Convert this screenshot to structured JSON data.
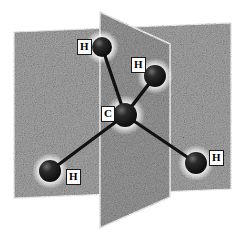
{
  "figure": {
    "width": 245,
    "height": 242,
    "background_color": "#ffffff"
  },
  "style": {
    "plane_fill_light": "#b4b4b4",
    "plane_fill_mid": "#9a9a9a",
    "plane_fill_dark": "#8a8a8a",
    "plane_edge_color": "#ffffff",
    "atom_color": "#151515",
    "atom_highlight": "#6e6e6e",
    "bond_color": "#111111",
    "label_bg": "#ffffff",
    "label_border": "#1a1a1a",
    "label_text": "#000000"
  },
  "planes": [
    {
      "name": "rear-horizontal-plane",
      "label": "rear plane",
      "points": "14,32 231,23 231,189 14,198",
      "shade": "#a8a8a8"
    },
    {
      "name": "front-vertical-plane",
      "label": "front plane",
      "points": "100,12 170,44 170,197 100,228",
      "shade": "#9c9c9c"
    }
  ],
  "atoms": [
    {
      "id": "C",
      "element": "C",
      "name": "carbon-atom",
      "label": "C",
      "cx": 125,
      "cy": 115,
      "r": 12,
      "label_x": 101,
      "label_y": 106
    },
    {
      "id": "H1",
      "element": "H",
      "name": "hydrogen-atom-top",
      "label": "H",
      "cx": 102,
      "cy": 47,
      "r": 10,
      "label_x": 77,
      "label_y": 39
    },
    {
      "id": "H2",
      "element": "H",
      "name": "hydrogen-atom-upper-right",
      "label": "H",
      "cx": 155,
      "cy": 76,
      "r": 11,
      "label_x": 131,
      "label_y": 57
    },
    {
      "id": "H3",
      "element": "H",
      "name": "hydrogen-atom-lower-left",
      "label": "H",
      "cx": 50,
      "cy": 171,
      "r": 11,
      "label_x": 66,
      "label_y": 169
    },
    {
      "id": "H4",
      "element": "H",
      "name": "hydrogen-atom-lower-right",
      "label": "H",
      "cx": 196,
      "cy": 163,
      "r": 11,
      "label_x": 209,
      "label_y": 150
    }
  ],
  "bonds": [
    {
      "name": "bond-c-h-top",
      "from": "C",
      "to": "H1"
    },
    {
      "name": "bond-c-h-upper-right",
      "from": "C",
      "to": "H2"
    },
    {
      "name": "bond-c-h-lower-left",
      "from": "C",
      "to": "H3"
    },
    {
      "name": "bond-c-h-lower-right",
      "from": "C",
      "to": "H4"
    }
  ]
}
